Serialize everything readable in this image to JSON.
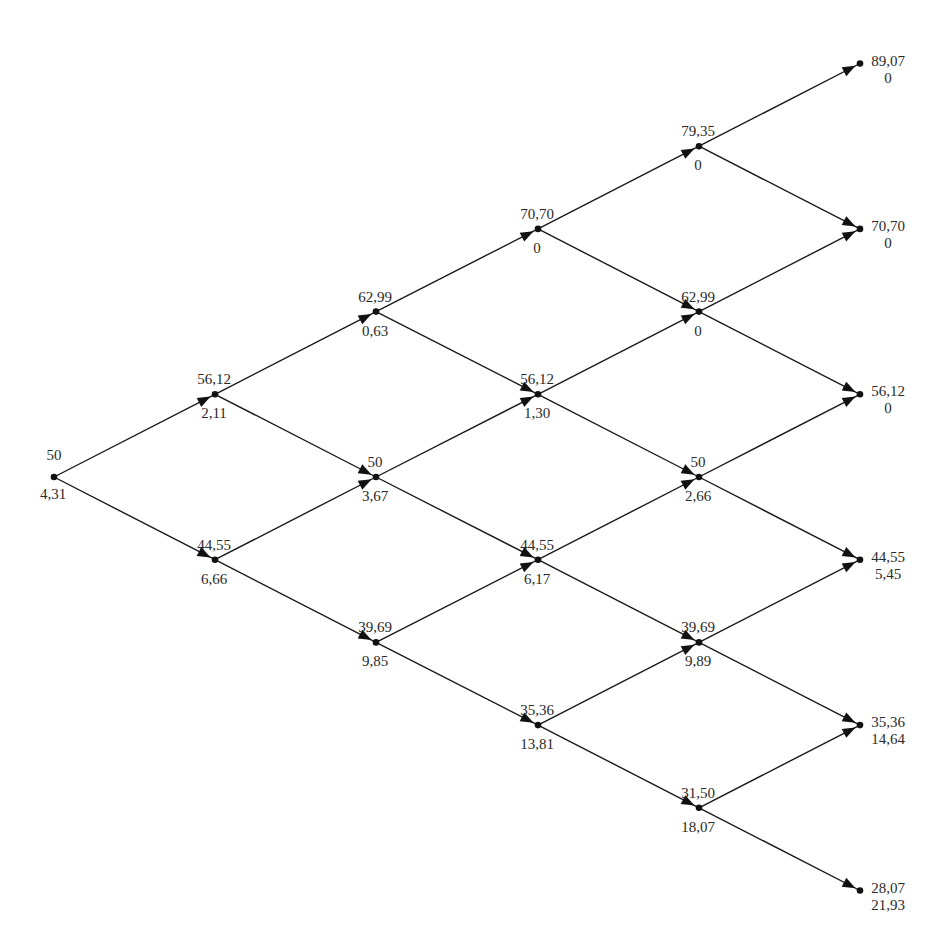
{
  "diagram": {
    "type": "binomial-tree",
    "steps": 5,
    "colors": {
      "line": "#1a1a1a",
      "text": "#2a2a2a",
      "background": "#ffffff"
    },
    "layout": {
      "col_x": [
        54,
        215,
        376,
        538,
        699,
        860
      ],
      "root_y": 477,
      "level_dy": 82.7
    },
    "nodes": [
      {
        "step": 0,
        "ups": 0,
        "price": "50",
        "value": "4,31"
      },
      {
        "step": 1,
        "ups": 1,
        "price": "56,12",
        "value": "2,11"
      },
      {
        "step": 1,
        "ups": 0,
        "price": "44,55",
        "value": "6,66"
      },
      {
        "step": 2,
        "ups": 2,
        "price": "62,99",
        "value": "0,63"
      },
      {
        "step": 2,
        "ups": 1,
        "price": "50",
        "value": "3,67"
      },
      {
        "step": 2,
        "ups": 0,
        "price": "39,69",
        "value": "9,85"
      },
      {
        "step": 3,
        "ups": 3,
        "price": "70,70",
        "value": "0"
      },
      {
        "step": 3,
        "ups": 2,
        "price": "56,12",
        "value": "1,30"
      },
      {
        "step": 3,
        "ups": 1,
        "price": "44,55",
        "value": "6,17"
      },
      {
        "step": 3,
        "ups": 0,
        "price": "35,36",
        "value": "13,81"
      },
      {
        "step": 4,
        "ups": 4,
        "price": "79,35",
        "value": "0"
      },
      {
        "step": 4,
        "ups": 3,
        "price": "62,99",
        "value": "0"
      },
      {
        "step": 4,
        "ups": 2,
        "price": "50",
        "value": "2,66"
      },
      {
        "step": 4,
        "ups": 1,
        "price": "39,69",
        "value": "9,89"
      },
      {
        "step": 4,
        "ups": 0,
        "price": "31,50",
        "value": "18,07"
      },
      {
        "step": 5,
        "ups": 5,
        "price": "89,07",
        "value": "0"
      },
      {
        "step": 5,
        "ups": 4,
        "price": "70,70",
        "value": "0"
      },
      {
        "step": 5,
        "ups": 3,
        "price": "56,12",
        "value": "0"
      },
      {
        "step": 5,
        "ups": 2,
        "price": "44,55",
        "value": "5,45"
      },
      {
        "step": 5,
        "ups": 1,
        "price": "35,36",
        "value": "14,64"
      },
      {
        "step": 5,
        "ups": 0,
        "price": "28,07",
        "value": "21,93"
      }
    ]
  }
}
